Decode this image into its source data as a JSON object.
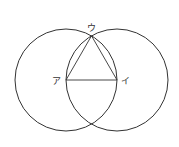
{
  "diagram": {
    "points": {
      "a": {
        "label": "ア"
      },
      "i": {
        "label": "イ"
      },
      "u": {
        "label": "ウ"
      }
    },
    "stroke_color": "#333333"
  }
}
